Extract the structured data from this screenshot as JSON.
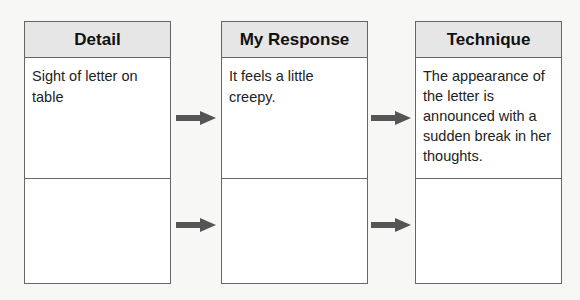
{
  "columns": [
    {
      "header": "Detail",
      "row1": "Sight of letter on table",
      "row2": ""
    },
    {
      "header": "My Response",
      "row1": "It feels a little creepy.",
      "row2": ""
    },
    {
      "header": "Technique",
      "row1": "The appearance of the letter is announced with a sudden break in her thoughts.",
      "row2": ""
    }
  ],
  "arrows": [
    {
      "from": "Detail",
      "to": "My Response",
      "row": 1
    },
    {
      "from": "My Response",
      "to": "Technique",
      "row": 1
    },
    {
      "from": "Detail",
      "to": "My Response",
      "row": 2
    },
    {
      "from": "My Response",
      "to": "Technique",
      "row": 2
    }
  ],
  "colors": {
    "header_bg": "#e6e6e6",
    "border": "#666666",
    "arrow": "#555555"
  }
}
